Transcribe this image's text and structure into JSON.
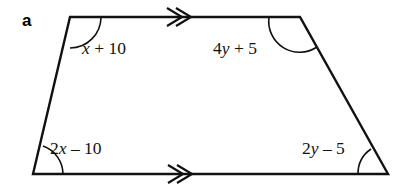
{
  "figure": {
    "part_label": "a",
    "shape": "trapezoid",
    "stroke_color": "#111111",
    "background_color": "#ffffff",
    "vertices": {
      "top_left": {
        "x": 70,
        "y": 17
      },
      "top_right": {
        "x": 300,
        "y": 17
      },
      "bottom_right": {
        "x": 388,
        "y": 174
      },
      "bottom_left": {
        "x": 33,
        "y": 174
      }
    },
    "parallel_marks": {
      "symbol": "double-chevron",
      "count": 2,
      "direction": "right",
      "edges": [
        "top",
        "bottom"
      ]
    },
    "angles": [
      {
        "name": "top-left",
        "expression": "x + 10",
        "coefficient": "",
        "variable": "x",
        "operator": "+",
        "constant": "10"
      },
      {
        "name": "top-right",
        "expression": "4y + 5",
        "coefficient": "4",
        "variable": "y",
        "operator": "+",
        "constant": "5"
      },
      {
        "name": "bottom-left",
        "expression": "2x – 10",
        "coefficient": "2",
        "variable": "x",
        "operator": "–",
        "constant": "10"
      },
      {
        "name": "bottom-right",
        "expression": "2y – 5",
        "coefficient": "2",
        "variable": "y",
        "operator": "–",
        "constant": "5"
      }
    ]
  }
}
